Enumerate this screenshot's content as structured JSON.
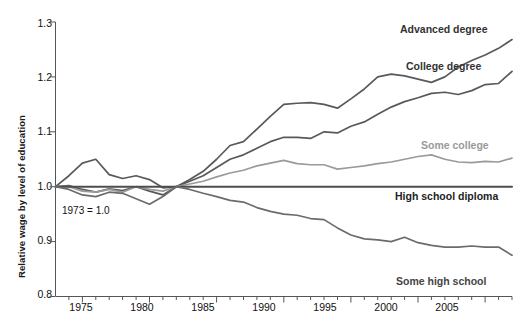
{
  "chart_data": {
    "type": "line",
    "title": "",
    "xlabel": "",
    "ylabel": "Relative wage by level of education",
    "xlim": [
      1973,
      2007
    ],
    "ylim": [
      0.8,
      1.3
    ],
    "grid": false,
    "legend_position": "inline-right-of-series",
    "annotation": "1973 = 1.0",
    "ytick_labels": [
      "1.3",
      "1.2",
      "1.1",
      "1.0",
      "0.9",
      "0.8"
    ],
    "yticks": [
      1.3,
      1.2,
      1.1,
      1.0,
      0.9,
      0.8
    ],
    "xtick_labels": [
      "1975",
      "1980",
      "1985",
      "1990",
      "1995",
      "2000",
      "2005"
    ],
    "xticks": [
      1975,
      1980,
      1985,
      1990,
      1995,
      2000,
      2005
    ],
    "x": [
      1973,
      1974,
      1975,
      1976,
      1977,
      1978,
      1979,
      1980,
      1981,
      1982,
      1983,
      1984,
      1985,
      1986,
      1987,
      1988,
      1989,
      1990,
      1991,
      1992,
      1993,
      1994,
      1995,
      1996,
      1997,
      1998,
      1999,
      2000,
      2001,
      2002,
      2003,
      2004,
      2005,
      2006,
      2007
    ],
    "series": [
      {
        "name": "Advanced degree",
        "color": "#595959",
        "values": [
          1.0,
          1.02,
          1.043,
          1.05,
          1.022,
          1.015,
          1.02,
          1.013,
          0.998,
          1.0,
          1.013,
          1.028,
          1.05,
          1.075,
          1.082,
          1.105,
          1.128,
          1.15,
          1.152,
          1.153,
          1.15,
          1.143,
          1.16,
          1.178,
          1.2,
          1.205,
          1.202,
          1.196,
          1.19,
          1.2,
          1.218,
          1.23,
          1.24,
          1.252,
          1.268
        ]
      },
      {
        "name": "College degree",
        "color": "#595959",
        "values": [
          1.0,
          1.002,
          0.995,
          0.99,
          0.996,
          0.993,
          1.0,
          0.992,
          0.985,
          1.0,
          1.01,
          1.02,
          1.035,
          1.05,
          1.058,
          1.07,
          1.082,
          1.09,
          1.09,
          1.088,
          1.1,
          1.098,
          1.11,
          1.118,
          1.132,
          1.145,
          1.155,
          1.162,
          1.17,
          1.172,
          1.168,
          1.175,
          1.186,
          1.188,
          1.21
        ]
      },
      {
        "name": "Some college",
        "color": "#9a9a9a",
        "values": [
          1.0,
          1.0,
          0.992,
          0.99,
          0.995,
          0.99,
          1.0,
          0.995,
          0.992,
          1.0,
          1.005,
          1.01,
          1.018,
          1.025,
          1.03,
          1.038,
          1.043,
          1.048,
          1.042,
          1.04,
          1.04,
          1.032,
          1.035,
          1.038,
          1.042,
          1.045,
          1.05,
          1.055,
          1.058,
          1.05,
          1.045,
          1.044,
          1.046,
          1.045,
          1.052
        ]
      },
      {
        "name": "High school diploma",
        "color": "#4d4d4d",
        "values": [
          1.0,
          1.0,
          1.0,
          1.0,
          1.0,
          1.0,
          1.0,
          1.0,
          1.0,
          1.0,
          1.0,
          1.0,
          1.0,
          1.0,
          1.0,
          1.0,
          1.0,
          1.0,
          1.0,
          1.0,
          1.0,
          1.0,
          1.0,
          1.0,
          1.0,
          1.0,
          1.0,
          1.0,
          1.0,
          1.0,
          1.0,
          1.0,
          1.0,
          1.0,
          1.0
        ]
      },
      {
        "name": "Some high school",
        "color": "#6b6b6b",
        "values": [
          1.0,
          0.995,
          0.985,
          0.982,
          0.99,
          0.988,
          0.978,
          0.968,
          0.982,
          1.0,
          0.995,
          0.988,
          0.982,
          0.975,
          0.972,
          0.962,
          0.955,
          0.95,
          0.948,
          0.942,
          0.94,
          0.925,
          0.912,
          0.905,
          0.903,
          0.9,
          0.908,
          0.898,
          0.893,
          0.89,
          0.89,
          0.892,
          0.89,
          0.89,
          0.875
        ]
      }
    ]
  },
  "labels": {
    "advanced_degree": "Advanced degree",
    "college_degree": "College degree",
    "some_college": "Some college",
    "high_school_diploma": "High school diploma",
    "some_high_school": "Some high school",
    "note": "1973 = 1.0",
    "ylabel": "Relative wage by level of education",
    "y_1_3": "1.3",
    "y_1_2": "1.2",
    "y_1_1": "1.1",
    "y_1_0": "1.0",
    "y_0_9": "0.9",
    "y_0_8": "0.8",
    "x_1975": "1975",
    "x_1980": "1980",
    "x_1985": "1985",
    "x_1990": "1990",
    "x_1995": "1995",
    "x_2000": "2000",
    "x_2005": "2005"
  }
}
